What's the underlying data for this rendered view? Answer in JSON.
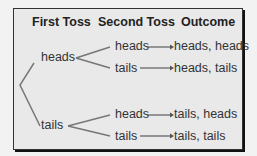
{
  "headers": {
    "first": "First Toss",
    "second": "Second Toss",
    "outcome": "Outcome"
  },
  "first_toss": [
    "heads",
    "tails"
  ],
  "second_toss": [
    "heads",
    "tails",
    "heads",
    "tails"
  ],
  "outcomes": [
    "heads, heads",
    "heads, tails",
    "tails, heads",
    "tails, tails"
  ],
  "colors": {
    "line": "#777777",
    "box": "#e9e9e9",
    "border": "#333333"
  }
}
